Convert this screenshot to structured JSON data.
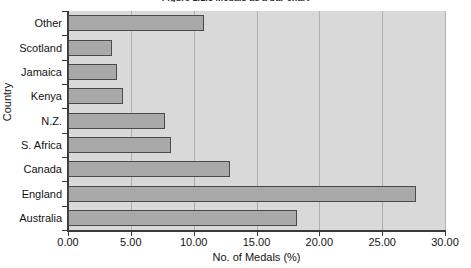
{
  "chart_data": {
    "type": "bar",
    "orientation": "horizontal",
    "title": "Figure 1.1.3 Medals as a bar chart",
    "title_clipped": true,
    "xlabel": "No. of Medals (%)",
    "ylabel": "Country",
    "categories": [
      "Other",
      "Scotland",
      "Jamaica",
      "Kenya",
      "N.Z.",
      "S. Africa",
      "Canada",
      "England",
      "Australia"
    ],
    "values": [
      10.8,
      3.5,
      3.9,
      4.4,
      7.7,
      8.2,
      12.9,
      27.7,
      18.2
    ],
    "xlim": [
      0,
      30
    ],
    "xticks": [
      0,
      5,
      10,
      15,
      20,
      25,
      30
    ],
    "xticklabels": [
      "0.00",
      "5.00",
      "10.00",
      "15.00",
      "20.00",
      "25.00",
      "30.00"
    ],
    "grid": "vertical",
    "legend": null,
    "colors": {
      "bar_fill": "#a9a9a9",
      "bar_edge": "#4a4a4a",
      "plot_background": "#d9d9d9",
      "gridline": "#b0b0b0",
      "axis": "#3a3a3a",
      "text": "#141414",
      "page_background": "#ffffff"
    }
  }
}
